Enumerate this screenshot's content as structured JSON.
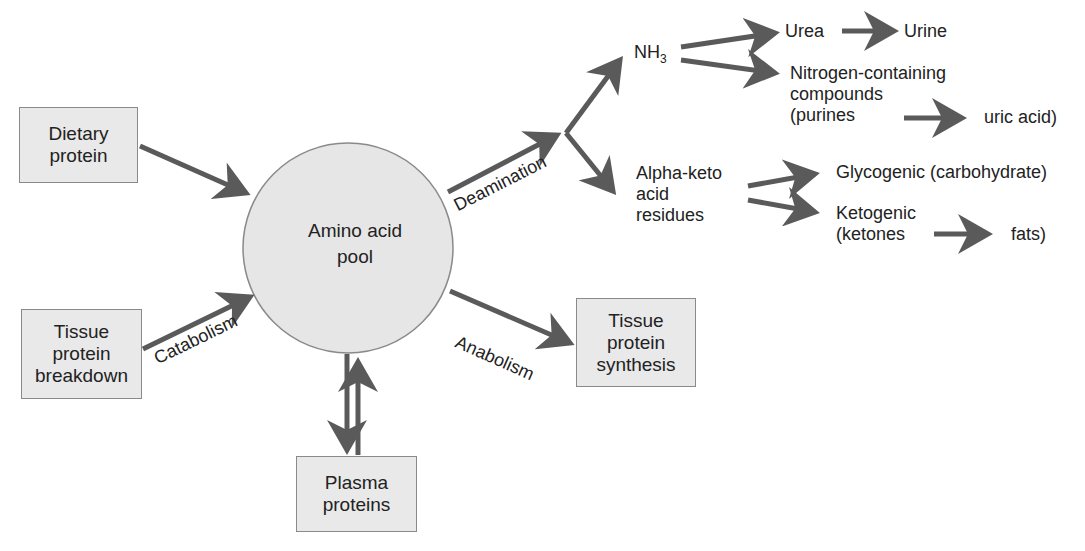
{
  "diagram": {
    "center": {
      "label": "Amino acid\npool"
    },
    "inputs": [
      {
        "id": "dietary",
        "label": "Dietary\nprotein"
      },
      {
        "id": "tissue-breakdown",
        "label": "Tissue\nprotein\nbreakdown",
        "edge_label": "Catabolism"
      }
    ],
    "outputs": [
      {
        "id": "tissue-synthesis",
        "label": "Tissue\nprotein\nsynthesis",
        "edge_label": "Anabolism"
      },
      {
        "id": "plasma",
        "label": "Plasma\nproteins",
        "bidirectional": true
      }
    ],
    "deamination": {
      "edge_label": "Deamination",
      "nh3": {
        "label": "NH",
        "subscript": "3"
      },
      "urea": "Urea",
      "urine": "Urine",
      "nitrogen_compounds": "Nitrogen-containing\ncompounds\n(purines",
      "uric_acid": "uric acid)",
      "alpha_keto": "Alpha-keto\nacid\nresidues",
      "glycogenic": "Glycogenic (carbohydrate)",
      "ketogenic": "Ketogenic\n(ketones",
      "fats": "fats)"
    },
    "colors": {
      "arrow": "#5a5a5a",
      "box_fill": "#e9e9e9",
      "circle_fill": "#e6e6e6",
      "border": "#8a8a8a"
    }
  }
}
